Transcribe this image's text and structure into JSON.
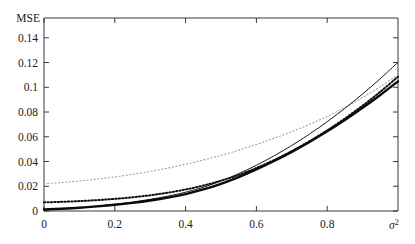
{
  "figure": {
    "background_color": "#ffffff",
    "frame_color": "#3a3a3a"
  },
  "chart_data": {
    "type": "line",
    "title": "",
    "subtitle": "",
    "xlabel": "σ²",
    "xlabel_base": "σ",
    "xlabel_exponent": "2",
    "ylabel": "MSE",
    "xlim": [
      0,
      1.0
    ],
    "ylim": [
      0,
      0.156
    ],
    "grid": false,
    "legend": "none",
    "xticks": [
      0,
      0.2,
      0.4,
      0.6,
      0.8
    ],
    "xticklabels": [
      "0",
      "0.2",
      "0.4",
      "0.6",
      "0.8"
    ],
    "yticks": [
      0,
      0.02,
      0.04,
      0.06,
      0.08,
      0.1,
      0.12,
      0.14
    ],
    "yticklabels": [
      "0",
      "0.02",
      "0.04",
      "0.06",
      "0.08",
      "0.1",
      "0.12",
      "0.14"
    ],
    "x": [
      0.0,
      0.05,
      0.1,
      0.15,
      0.2,
      0.25,
      0.3,
      0.35,
      0.4,
      0.45,
      0.5,
      0.55,
      0.6,
      0.65,
      0.7,
      0.75,
      0.8,
      0.85,
      0.9,
      0.95,
      1.0
    ],
    "series": [
      {
        "name": "upper-dotted-light",
        "style": "dotted",
        "color": "#9a9a9a",
        "width": 1.1,
        "dash": "1,2.6",
        "values": [
          0.022,
          0.023,
          0.0243,
          0.0258,
          0.0276,
          0.0296,
          0.032,
          0.0347,
          0.0378,
          0.0412,
          0.045,
          0.0492,
          0.0538,
          0.0588,
          0.0642,
          0.07,
          0.0765,
          0.0838,
          0.0918,
          0.1005,
          0.11
        ]
      },
      {
        "name": "dotted-black",
        "style": "dotted",
        "color": "#111111",
        "width": 2.0,
        "dash": "1.4,2.0",
        "values": [
          0.007,
          0.0074,
          0.008,
          0.0088,
          0.0098,
          0.0111,
          0.0127,
          0.0148,
          0.0174,
          0.0206,
          0.0245,
          0.0292,
          0.0348,
          0.0412,
          0.0484,
          0.0564,
          0.0652,
          0.0748,
          0.0852,
          0.0964,
          0.1085
        ]
      },
      {
        "name": "thin-solid-black",
        "style": "solid",
        "color": "#1a1a1a",
        "width": 1.0,
        "dash": "",
        "values": [
          0.0012,
          0.0018,
          0.0027,
          0.0039,
          0.0054,
          0.0072,
          0.0094,
          0.012,
          0.0152,
          0.0192,
          0.0242,
          0.0302,
          0.037,
          0.0446,
          0.053,
          0.0622,
          0.0722,
          0.083,
          0.0946,
          0.107,
          0.1202
        ]
      },
      {
        "name": "thick-solid-black",
        "style": "solid",
        "color": "#0a0a0a",
        "width": 2.4,
        "dash": "",
        "values": [
          0.0012,
          0.0018,
          0.0026,
          0.0037,
          0.005,
          0.0066,
          0.0085,
          0.0108,
          0.0137,
          0.0174,
          0.022,
          0.0274,
          0.0336,
          0.0404,
          0.0478,
          0.0558,
          0.0644,
          0.0736,
          0.0834,
          0.0938,
          0.1048
        ]
      }
    ]
  }
}
